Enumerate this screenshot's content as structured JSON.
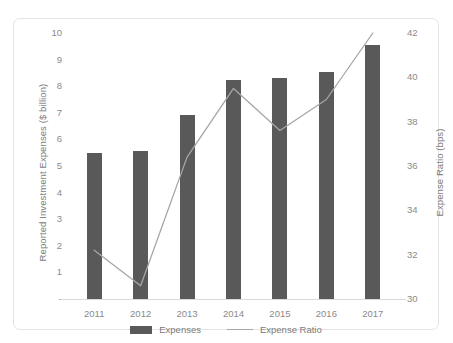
{
  "chart_data": {
    "type": "bar",
    "title": "",
    "subtitle": "",
    "xlabel": "",
    "ylabel": "Reported Investment Expenses ($ billion)",
    "y2label": "Expense Ratio (bps)",
    "categories": [
      "2011",
      "2012",
      "2013",
      "2014",
      "2015",
      "2016",
      "2017"
    ],
    "series": [
      {
        "name": "Expenses",
        "type": "bar",
        "axis": "left",
        "unit": "$ billion",
        "color": "#595959",
        "values": [
          5.5,
          5.55,
          6.9,
          8.25,
          8.3,
          8.55,
          9.55
        ]
      },
      {
        "name": "Expense Ratio",
        "type": "line",
        "axis": "right",
        "unit": "bps",
        "color": "#a6a6a6",
        "values": [
          32.2,
          30.6,
          36.4,
          39.5,
          37.6,
          39.0,
          42.0
        ]
      }
    ],
    "ylim": [
      0,
      10
    ],
    "y2lim": [
      30,
      42
    ],
    "yticks": [
      "-",
      "1",
      "2",
      "3",
      "4",
      "5",
      "6",
      "7",
      "8",
      "9",
      "10"
    ],
    "ytick_values": [
      0,
      1,
      2,
      3,
      4,
      5,
      6,
      7,
      8,
      9,
      10
    ],
    "y2ticks": [
      "30",
      "32",
      "34",
      "36",
      "38",
      "40",
      "42"
    ],
    "y2tick_values": [
      30,
      32,
      34,
      36,
      38,
      40,
      42
    ],
    "grid": false,
    "legend_position": "bottom"
  },
  "legend": {
    "items": [
      {
        "label": "Expenses",
        "marker": "bar-swatch"
      },
      {
        "label": "Expense Ratio",
        "marker": "line-swatch"
      }
    ]
  },
  "colors": {
    "bar": "#595959",
    "line": "#a6a6a6",
    "axis": "#d9d9d9",
    "text": "#7f7f7f",
    "frame": "#e4e4e4",
    "background": "#ffffff"
  }
}
